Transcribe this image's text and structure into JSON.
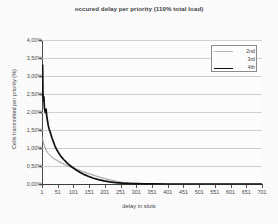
{
  "chart_data": {
    "type": "line",
    "title": "occured delay per priority (110% total load)",
    "xlabel": "delay in slots",
    "ylabel": "Cells transmitted per priority (%)",
    "xlim": [
      1,
      701
    ],
    "ylim": [
      0,
      4
    ],
    "grid": true,
    "legend_position": "top-right",
    "xticks": [
      "1",
      "51",
      "101",
      "151",
      "201",
      "251",
      "301",
      "351",
      "401",
      "451",
      "501",
      "551",
      "601",
      "651",
      "701"
    ],
    "xtick_values": [
      1,
      51,
      101,
      151,
      201,
      251,
      301,
      351,
      401,
      451,
      501,
      551,
      601,
      651,
      701
    ],
    "yticks": [
      "0,00%",
      "0,50%",
      "1,00%",
      "1,50%",
      "2,00%",
      "2,50%",
      "3,00%",
      "3,50%",
      "4,00%"
    ],
    "ytick_values": [
      0,
      0.5,
      1.0,
      1.5,
      2.0,
      2.5,
      3.0,
      3.5,
      4.0
    ],
    "series": [
      {
        "name": "2nd",
        "color": "#b8b8b8",
        "width": 0.7,
        "x": [
          1,
          3,
          5,
          8,
          11,
          15,
          20,
          26,
          33,
          41,
          51,
          61,
          73,
          86,
          101,
          116,
          131,
          151,
          171,
          191,
          211,
          231,
          251,
          271,
          291,
          311,
          341,
          371,
          401,
          451,
          501,
          551,
          601,
          651,
          701
        ],
        "values": [
          1.28,
          1.22,
          1.15,
          1.06,
          0.99,
          0.92,
          0.85,
          0.79,
          0.73,
          0.68,
          0.63,
          0.58,
          0.53,
          0.48,
          0.43,
          0.38,
          0.33,
          0.27,
          0.22,
          0.17,
          0.12,
          0.08,
          0.05,
          0.03,
          0.02,
          0.01,
          0.01,
          0.0,
          0.0,
          0.0,
          0.0,
          0.0,
          0.0,
          0.0,
          0.0
        ]
      },
      {
        "name": "3rd",
        "color": "#9a9a9a",
        "width": 0.8,
        "x": [
          1,
          3,
          5,
          8,
          11,
          15,
          20,
          26,
          33,
          41,
          51,
          61,
          73,
          86,
          101,
          116,
          131,
          151,
          171,
          191,
          211,
          231,
          251,
          271,
          291,
          311,
          341,
          371,
          401,
          451,
          501,
          551,
          601,
          651,
          701
        ],
        "values": [
          1.32,
          1.26,
          1.18,
          1.08,
          1.0,
          0.93,
          0.86,
          0.8,
          0.75,
          0.7,
          0.65,
          0.6,
          0.55,
          0.5,
          0.45,
          0.4,
          0.35,
          0.29,
          0.23,
          0.18,
          0.13,
          0.09,
          0.055,
          0.035,
          0.02,
          0.012,
          0.006,
          0.002,
          0.0,
          0.0,
          0.0,
          0.0,
          0.0,
          0.0,
          0.0
        ]
      },
      {
        "name": "4th",
        "color": "#111111",
        "width": 1.7,
        "x": [
          1,
          2,
          3,
          4,
          5,
          6,
          7,
          8,
          9,
          10,
          12,
          14,
          16,
          18,
          21,
          24,
          28,
          32,
          37,
          42,
          48,
          55,
          62,
          70,
          79,
          89,
          100,
          111,
          123,
          136,
          150,
          165,
          181,
          198,
          216,
          235,
          255,
          276,
          301,
          331,
          361,
          401,
          451,
          501,
          551,
          601,
          651,
          701
        ],
        "values": [
          2.5,
          2.46,
          3.3,
          2.55,
          2.38,
          2.3,
          2.42,
          2.22,
          2.1,
          2.05,
          1.98,
          2.08,
          1.9,
          1.78,
          1.62,
          1.52,
          1.42,
          1.3,
          1.18,
          1.06,
          0.95,
          0.85,
          0.76,
          0.68,
          0.6,
          0.52,
          0.45,
          0.38,
          0.32,
          0.26,
          0.21,
          0.16,
          0.12,
          0.085,
          0.06,
          0.04,
          0.025,
          0.015,
          0.008,
          0.004,
          0.002,
          0.0,
          0.0,
          0.0,
          0.0,
          0.0,
          0.0,
          0.0
        ]
      }
    ]
  }
}
